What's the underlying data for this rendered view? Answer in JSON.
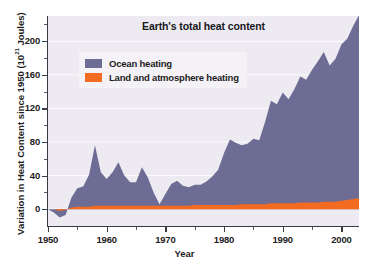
{
  "chart_data": {
    "type": "area",
    "title": "Earth's total heat content",
    "xlabel": "Year",
    "ylabel_prefix": "Variation in Heat Content since 1950 (10",
    "ylabel_exponent": "21",
    "ylabel_suffix": " Joules)",
    "xlim": [
      1950,
      2003
    ],
    "ylim": [
      -20,
      230
    ],
    "yticks": [
      0,
      40,
      80,
      120,
      160,
      200
    ],
    "ytick_labels": [
      "0",
      "40",
      "80",
      "120",
      "160",
      "200"
    ],
    "ytick_minors": [
      20,
      60,
      100,
      140,
      180,
      220
    ],
    "xticks": [
      1950,
      1960,
      1970,
      1980,
      1990,
      2000
    ],
    "xtick_labels": [
      "1950",
      "1960",
      "1970",
      "1980",
      "1990",
      "2000"
    ],
    "xtick_minors": [
      1955,
      1965,
      1975,
      1985,
      1995
    ],
    "grid": true,
    "legend_position": "upper-left",
    "stacked": true,
    "colors": {
      "ocean": "#6d6c94",
      "land": "#f26b21",
      "plot_background": "#edeaf1",
      "legend_background": "#f4f2f7",
      "axis": "#3a3a45",
      "gridline": "#ffffff",
      "text": "#1d1d22",
      "page_background": "#ffffff"
    },
    "series": [
      {
        "name": "Land and atmosphere heating",
        "color": "#f26b21",
        "values": [
          0,
          0,
          -2,
          -1,
          2,
          3,
          3,
          3,
          4,
          4,
          4,
          4,
          4,
          4,
          4,
          4,
          4,
          4,
          4,
          4,
          4,
          4,
          4,
          4,
          4,
          5,
          5,
          5,
          5,
          5,
          5,
          5,
          5,
          6,
          6,
          6,
          6,
          6,
          7,
          7,
          7,
          7,
          7,
          8,
          8,
          8,
          8,
          9,
          9,
          9,
          10,
          11,
          12,
          13
        ]
      },
      {
        "name": "Ocean heating",
        "color": "#6d6c94",
        "values": [
          0,
          -4,
          -8,
          -6,
          12,
          22,
          24,
          38,
          72,
          40,
          32,
          40,
          52,
          36,
          28,
          28,
          46,
          34,
          16,
          2,
          14,
          26,
          30,
          24,
          22,
          24,
          24,
          28,
          34,
          42,
          62,
          78,
          74,
          70,
          72,
          78,
          76,
          98,
          122,
          118,
          132,
          124,
          136,
          150,
          146,
          158,
          168,
          178,
          162,
          170,
          186,
          192,
          206,
          218
        ]
      }
    ],
    "x": [
      1950,
      1951,
      1952,
      1953,
      1954,
      1955,
      1956,
      1957,
      1958,
      1959,
      1960,
      1961,
      1962,
      1963,
      1964,
      1965,
      1966,
      1967,
      1968,
      1969,
      1970,
      1971,
      1972,
      1973,
      1974,
      1975,
      1976,
      1977,
      1978,
      1979,
      1980,
      1981,
      1982,
      1983,
      1984,
      1985,
      1986,
      1987,
      1988,
      1989,
      1990,
      1991,
      1992,
      1993,
      1994,
      1995,
      1996,
      1997,
      1998,
      1999,
      2000,
      2001,
      2002,
      2003
    ]
  },
  "legend": {
    "items": [
      {
        "label": "Ocean heating",
        "color": "#6d6c94"
      },
      {
        "label": "Land and atmosphere heating",
        "color": "#f26b21"
      }
    ]
  }
}
